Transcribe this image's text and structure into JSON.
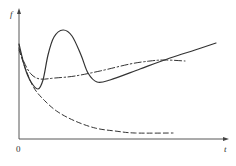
{
  "chart_data": {
    "type": "line",
    "title": "",
    "xlabel": "t",
    "ylabel": "f",
    "origin_label": "0",
    "grid": false,
    "legend": null,
    "x_ticks": [],
    "y_ticks": [],
    "series": [
      {
        "name": "solid",
        "style": "solid",
        "color": "#333333",
        "shape": "starts high, dips to a minimum, rises to a sharp peak, falls to a second minimum, then rises steadily",
        "points_px": [
          [
            19,
            44
          ],
          [
            25,
            68
          ],
          [
            31,
            82
          ],
          [
            38,
            89
          ],
          [
            43,
            80
          ],
          [
            48,
            55
          ],
          [
            54,
            37
          ],
          [
            63,
            30
          ],
          [
            72,
            36
          ],
          [
            81,
            55
          ],
          [
            88,
            73
          ],
          [
            97,
            82
          ],
          [
            110,
            80
          ],
          [
            140,
            69
          ],
          [
            170,
            58
          ],
          [
            195,
            50
          ],
          [
            216,
            43
          ]
        ]
      },
      {
        "name": "dash-dot",
        "style": "dash-dot",
        "color": "#333333",
        "shape": "starts high, dips to a shallow minimum, then gradually rises and levels off",
        "points_px": [
          [
            19,
            48
          ],
          [
            24,
            62
          ],
          [
            31,
            74
          ],
          [
            40,
            79
          ],
          [
            55,
            78
          ],
          [
            75,
            76
          ],
          [
            100,
            71
          ],
          [
            130,
            64
          ],
          [
            150,
            61
          ],
          [
            165,
            60
          ],
          [
            185,
            61
          ]
        ]
      },
      {
        "name": "dashed",
        "style": "dashed",
        "color": "#333333",
        "shape": "monotonic decay from high value to a low asymptote",
        "points_px": [
          [
            19,
            50
          ],
          [
            26,
            70
          ],
          [
            34,
            88
          ],
          [
            45,
            101
          ],
          [
            58,
            112
          ],
          [
            75,
            121
          ],
          [
            95,
            128
          ],
          [
            115,
            131
          ],
          [
            135,
            133
          ],
          [
            173,
            133
          ]
        ]
      }
    ],
    "axes": {
      "origin_px": [
        19,
        139
      ],
      "y_axis_top_px": [
        19,
        8
      ],
      "x_axis_end_px": [
        229,
        139
      ]
    }
  },
  "labels": {
    "y_axis": "f",
    "x_axis": "t",
    "origin": "0"
  }
}
